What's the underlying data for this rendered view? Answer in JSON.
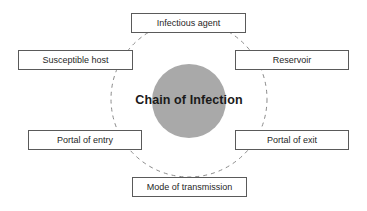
{
  "diagram": {
    "title": "Chain of Infection",
    "type": "cycle-diagram",
    "background_color": "#ffffff",
    "hub": {
      "label": "Chain of Infection",
      "fill_color": "#a9a9a9",
      "center_x": 189,
      "center_y": 101,
      "radius": 37
    },
    "ring": {
      "style": "dashed",
      "stroke_color": "#808080",
      "center_x": 189,
      "center_y": 99,
      "radius": 78
    },
    "nodes": [
      {
        "id": "infectious-agent",
        "label": "Infectious agent",
        "position": "top",
        "x": 131,
        "y": 13,
        "width": 115,
        "height": 20
      },
      {
        "id": "reservoir",
        "label": "Reservoir",
        "position": "top-right",
        "x": 235,
        "y": 50,
        "width": 114,
        "height": 20
      },
      {
        "id": "portal-of-exit",
        "label": "Portal of exit",
        "position": "bottom-right",
        "x": 235,
        "y": 130,
        "width": 114,
        "height": 20
      },
      {
        "id": "mode-of-transmission",
        "label": "Mode of transmission",
        "position": "bottom",
        "x": 132,
        "y": 177,
        "width": 115,
        "height": 20
      },
      {
        "id": "portal-of-entry",
        "label": "Portal of entry",
        "position": "bottom-left",
        "x": 28,
        "y": 130,
        "width": 114,
        "height": 20
      },
      {
        "id": "susceptible-host",
        "label": "Susceptible host",
        "position": "top-left",
        "x": 18,
        "y": 50,
        "width": 115,
        "height": 20
      }
    ]
  }
}
